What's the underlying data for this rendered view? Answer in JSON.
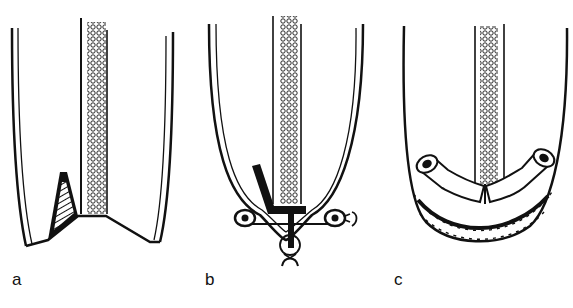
{
  "figure": {
    "panels": [
      {
        "id": "a",
        "label": "a",
        "description": "Stapled organ end with tube and hatched wedge incision"
      },
      {
        "id": "b",
        "label": "b",
        "description": "Organ tip with T-shaped instrument and suture loops"
      },
      {
        "id": "c",
        "label": "c",
        "description": "Rounded organ end with anastomosed tube segments and sutured closure"
      }
    ],
    "colors": {
      "ink": "#111111",
      "background": "#ffffff"
    }
  }
}
